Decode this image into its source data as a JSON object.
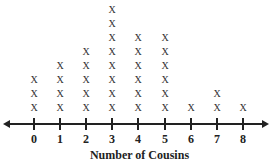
{
  "chart_data": {
    "type": "dot-plot",
    "title": "",
    "xlabel": "Number of Cousins",
    "ylabel": "",
    "categories": [
      "0",
      "1",
      "2",
      "3",
      "4",
      "5",
      "6",
      "7",
      "8"
    ],
    "values": [
      3,
      4,
      5,
      8,
      6,
      6,
      1,
      2,
      1
    ],
    "marker": "X",
    "xlim": [
      0,
      8
    ],
    "grid": false,
    "legend": null
  },
  "axis": {
    "title": "Number of Cousins",
    "tick_labels": [
      "0",
      "1",
      "2",
      "3",
      "4",
      "5",
      "6",
      "7",
      "8"
    ]
  }
}
